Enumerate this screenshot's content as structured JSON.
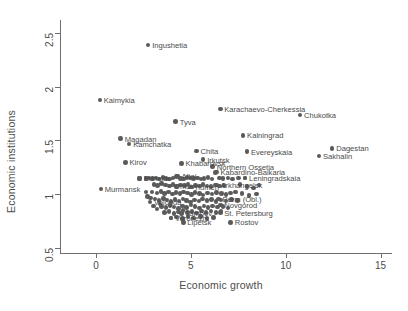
{
  "chart_data": {
    "type": "scatter",
    "title": "",
    "xlabel": "Economic growth",
    "ylabel": "Economic institutions",
    "xlim": [
      -1.9,
      15.6
    ],
    "ylim": [
      0.45,
      2.62
    ],
    "xticks": [
      0,
      5,
      10,
      15
    ],
    "yticks": [
      0.5,
      1,
      1.5,
      2,
      2.5
    ],
    "xtick_labels": [
      "0",
      "5",
      "10",
      "15"
    ],
    "ytick_labels": [
      "0.5",
      "1",
      "1.5",
      "2",
      "2.5"
    ],
    "grid": false,
    "legend": null,
    "marker_color": "#5a5a5a",
    "axis_color": "#6f6f6f",
    "label_color": "#4a4a4a",
    "background": "#ffffff",
    "labeled_points": [
      {
        "label": "Ingushetia",
        "x": 2.75,
        "y": 2.385,
        "side": "right"
      },
      {
        "label": "Kalmykia",
        "x": 0.2,
        "y": 1.875,
        "side": "right"
      },
      {
        "label": "Karachaevo-Cherkessia",
        "x": 6.55,
        "y": 1.79,
        "side": "right"
      },
      {
        "label": "Chukotka",
        "x": 10.75,
        "y": 1.735,
        "side": "right"
      },
      {
        "label": "Tyva",
        "x": 4.2,
        "y": 1.675,
        "side": "right"
      },
      {
        "label": "Kalningrad",
        "x": 7.75,
        "y": 1.545,
        "side": "right"
      },
      {
        "label": "Magadan",
        "x": 1.3,
        "y": 1.515,
        "side": "right"
      },
      {
        "label": "Kamchatka",
        "x": 1.75,
        "y": 1.465,
        "side": "right"
      },
      {
        "label": "Dagestan",
        "x": 12.45,
        "y": 1.425,
        "side": "right"
      },
      {
        "label": "Chita",
        "x": 5.3,
        "y": 1.4,
        "side": "right"
      },
      {
        "label": "Evereyskaia",
        "x": 7.95,
        "y": 1.395,
        "side": "right"
      },
      {
        "label": "Sakhalin",
        "x": 11.75,
        "y": 1.355,
        "side": "right"
      },
      {
        "label": "Kirov",
        "x": 1.55,
        "y": 1.295,
        "side": "right"
      },
      {
        "label": "Khabarovsk",
        "x": 4.5,
        "y": 1.285,
        "side": "right"
      },
      {
        "label": "Irkutsk",
        "x": 5.65,
        "y": 1.32,
        "side": "right"
      },
      {
        "label": "Northern Ossetia",
        "x": 6.15,
        "y": 1.255,
        "side": "right"
      },
      {
        "label": "Kabardino-Balkaria",
        "x": 6.35,
        "y": 1.205,
        "side": "right"
      },
      {
        "label": "Altai",
        "x": 4.3,
        "y": 1.165,
        "side": "right"
      },
      {
        "label": "Leningradskaia",
        "x": 7.85,
        "y": 1.15,
        "side": "right"
      },
      {
        "label": "Buriatia",
        "x": 2.3,
        "y": 1.145,
        "side": "right"
      },
      {
        "label": "Arkhangelsk",
        "x": 6.35,
        "y": 1.085,
        "side": "right"
      },
      {
        "label": "Tiumen",
        "x": 4.95,
        "y": 1.065,
        "side": "right"
      },
      {
        "label": "Omsk",
        "x": 3.9,
        "y": 1.075,
        "side": "right"
      },
      {
        "label": "Murmansk",
        "x": 0.25,
        "y": 1.045,
        "side": "right"
      },
      {
        "label": "Perm (Obl.)",
        "x": 6.45,
        "y": 0.955,
        "side": "right"
      },
      {
        "label": "Vologda",
        "x": 2.85,
        "y": 0.925,
        "side": "right"
      },
      {
        "label": "Novgorod",
        "x": 6.55,
        "y": 0.895,
        "side": "right"
      },
      {
        "label": "St. Petersburg",
        "x": 6.55,
        "y": 0.825,
        "side": "right"
      },
      {
        "label": "Tambov",
        "x": 4.5,
        "y": 0.82,
        "side": "right"
      },
      {
        "label": "Voronezh",
        "x": 3.95,
        "y": 0.775,
        "side": "right"
      },
      {
        "label": "Lipetsk",
        "x": 4.6,
        "y": 0.735,
        "side": "right"
      },
      {
        "label": "Rostov",
        "x": 7.1,
        "y": 0.735,
        "side": "right"
      }
    ],
    "cluster_points": [
      {
        "x": 2.3,
        "y": 1.145
      },
      {
        "x": 2.62,
        "y": 1.145
      },
      {
        "x": 2.8,
        "y": 1.15
      },
      {
        "x": 2.98,
        "y": 1.142
      },
      {
        "x": 3.15,
        "y": 1.148
      },
      {
        "x": 3.33,
        "y": 1.14
      },
      {
        "x": 3.52,
        "y": 1.152
      },
      {
        "x": 3.7,
        "y": 1.145
      },
      {
        "x": 3.88,
        "y": 1.138
      },
      {
        "x": 4.05,
        "y": 1.15
      },
      {
        "x": 4.25,
        "y": 1.162
      },
      {
        "x": 4.45,
        "y": 1.145
      },
      {
        "x": 4.62,
        "y": 1.14
      },
      {
        "x": 4.8,
        "y": 1.155
      },
      {
        "x": 4.98,
        "y": 1.148
      },
      {
        "x": 5.15,
        "y": 1.142
      },
      {
        "x": 5.35,
        "y": 1.15
      },
      {
        "x": 5.52,
        "y": 1.138
      },
      {
        "x": 5.7,
        "y": 1.145
      },
      {
        "x": 5.9,
        "y": 1.152
      },
      {
        "x": 6.1,
        "y": 1.14
      },
      {
        "x": 6.3,
        "y": 1.2
      },
      {
        "x": 6.5,
        "y": 1.15
      },
      {
        "x": 6.7,
        "y": 1.145
      },
      {
        "x": 6.95,
        "y": 1.148
      },
      {
        "x": 7.2,
        "y": 1.14
      },
      {
        "x": 7.5,
        "y": 1.15
      },
      {
        "x": 7.85,
        "y": 1.148
      },
      {
        "x": 3.05,
        "y": 1.09
      },
      {
        "x": 3.25,
        "y": 1.078
      },
      {
        "x": 3.45,
        "y": 1.095
      },
      {
        "x": 3.65,
        "y": 1.082
      },
      {
        "x": 3.85,
        "y": 1.075
      },
      {
        "x": 4.05,
        "y": 1.088
      },
      {
        "x": 4.25,
        "y": 1.07
      },
      {
        "x": 4.45,
        "y": 1.085
      },
      {
        "x": 4.65,
        "y": 1.078
      },
      {
        "x": 4.85,
        "y": 1.092
      },
      {
        "x": 5.05,
        "y": 1.065
      },
      {
        "x": 5.25,
        "y": 1.08
      },
      {
        "x": 5.45,
        "y": 1.072
      },
      {
        "x": 5.65,
        "y": 1.088
      },
      {
        "x": 5.85,
        "y": 1.075
      },
      {
        "x": 6.05,
        "y": 1.068
      },
      {
        "x": 6.28,
        "y": 1.085
      },
      {
        "x": 6.5,
        "y": 1.072
      },
      {
        "x": 6.75,
        "y": 1.08
      },
      {
        "x": 2.95,
        "y": 1.02
      },
      {
        "x": 3.2,
        "y": 1.01
      },
      {
        "x": 3.42,
        "y": 1.025
      },
      {
        "x": 3.62,
        "y": 1.005
      },
      {
        "x": 3.82,
        "y": 1.018
      },
      {
        "x": 4.02,
        "y": 0.998
      },
      {
        "x": 4.22,
        "y": 1.012
      },
      {
        "x": 4.42,
        "y": 1.002
      },
      {
        "x": 4.62,
        "y": 1.02
      },
      {
        "x": 4.82,
        "y": 1.008
      },
      {
        "x": 5.02,
        "y": 0.995
      },
      {
        "x": 5.22,
        "y": 1.015
      },
      {
        "x": 5.45,
        "y": 1.005
      },
      {
        "x": 5.65,
        "y": 0.992
      },
      {
        "x": 5.88,
        "y": 1.01
      },
      {
        "x": 6.1,
        "y": 1.0
      },
      {
        "x": 6.35,
        "y": 1.015
      },
      {
        "x": 6.6,
        "y": 1.002
      },
      {
        "x": 6.85,
        "y": 0.995
      },
      {
        "x": 7.1,
        "y": 1.008
      },
      {
        "x": 3.1,
        "y": 0.952
      },
      {
        "x": 3.32,
        "y": 0.938
      },
      {
        "x": 3.55,
        "y": 0.958
      },
      {
        "x": 3.75,
        "y": 0.945
      },
      {
        "x": 3.95,
        "y": 0.93
      },
      {
        "x": 4.15,
        "y": 0.948
      },
      {
        "x": 4.38,
        "y": 0.935
      },
      {
        "x": 4.58,
        "y": 0.955
      },
      {
        "x": 4.78,
        "y": 0.94
      },
      {
        "x": 4.98,
        "y": 0.925
      },
      {
        "x": 5.2,
        "y": 0.945
      },
      {
        "x": 5.42,
        "y": 0.932
      },
      {
        "x": 5.62,
        "y": 0.952
      },
      {
        "x": 5.85,
        "y": 0.938
      },
      {
        "x": 6.08,
        "y": 0.948
      },
      {
        "x": 6.32,
        "y": 0.93
      },
      {
        "x": 6.58,
        "y": 0.945
      },
      {
        "x": 6.85,
        "y": 0.935
      },
      {
        "x": 7.15,
        "y": 0.95
      },
      {
        "x": 7.45,
        "y": 0.94
      },
      {
        "x": 3.45,
        "y": 0.885
      },
      {
        "x": 3.68,
        "y": 0.872
      },
      {
        "x": 3.9,
        "y": 0.892
      },
      {
        "x": 4.12,
        "y": 0.878
      },
      {
        "x": 4.35,
        "y": 0.865
      },
      {
        "x": 4.55,
        "y": 0.888
      },
      {
        "x": 4.78,
        "y": 0.875
      },
      {
        "x": 5.0,
        "y": 0.895
      },
      {
        "x": 5.22,
        "y": 0.882
      },
      {
        "x": 5.45,
        "y": 0.868
      },
      {
        "x": 5.68,
        "y": 0.888
      },
      {
        "x": 5.9,
        "y": 0.872
      },
      {
        "x": 6.15,
        "y": 0.89
      },
      {
        "x": 6.4,
        "y": 0.878
      },
      {
        "x": 6.68,
        "y": 0.885
      },
      {
        "x": 6.95,
        "y": 0.87
      },
      {
        "x": 3.6,
        "y": 0.825
      },
      {
        "x": 3.85,
        "y": 0.838
      },
      {
        "x": 4.1,
        "y": 0.82
      },
      {
        "x": 4.35,
        "y": 0.832
      },
      {
        "x": 4.58,
        "y": 0.845
      },
      {
        "x": 4.82,
        "y": 0.825
      },
      {
        "x": 5.05,
        "y": 0.838
      },
      {
        "x": 5.3,
        "y": 0.822
      },
      {
        "x": 5.55,
        "y": 0.84
      },
      {
        "x": 5.8,
        "y": 0.828
      },
      {
        "x": 6.05,
        "y": 0.842
      },
      {
        "x": 6.32,
        "y": 0.825
      },
      {
        "x": 6.58,
        "y": 0.835
      },
      {
        "x": 3.95,
        "y": 0.778
      },
      {
        "x": 4.25,
        "y": 0.785
      },
      {
        "x": 4.55,
        "y": 0.772
      },
      {
        "x": 4.85,
        "y": 0.79
      },
      {
        "x": 5.15,
        "y": 0.775
      },
      {
        "x": 5.5,
        "y": 0.788
      },
      {
        "x": 5.85,
        "y": 0.772
      },
      {
        "x": 6.2,
        "y": 0.782
      },
      {
        "x": 2.62,
        "y": 1.02
      },
      {
        "x": 2.7,
        "y": 0.975
      },
      {
        "x": 2.88,
        "y": 0.96
      },
      {
        "x": 3.02,
        "y": 0.89
      },
      {
        "x": 3.2,
        "y": 0.862
      },
      {
        "x": 3.38,
        "y": 0.905
      },
      {
        "x": 7.6,
        "y": 1.09
      },
      {
        "x": 7.95,
        "y": 1.07
      },
      {
        "x": 8.3,
        "y": 1.055
      },
      {
        "x": 8.6,
        "y": 1.082
      },
      {
        "x": 7.35,
        "y": 1.02
      },
      {
        "x": 7.7,
        "y": 1.002
      },
      {
        "x": 8.05,
        "y": 0.985
      },
      {
        "x": 8.45,
        "y": 0.998
      }
    ]
  }
}
